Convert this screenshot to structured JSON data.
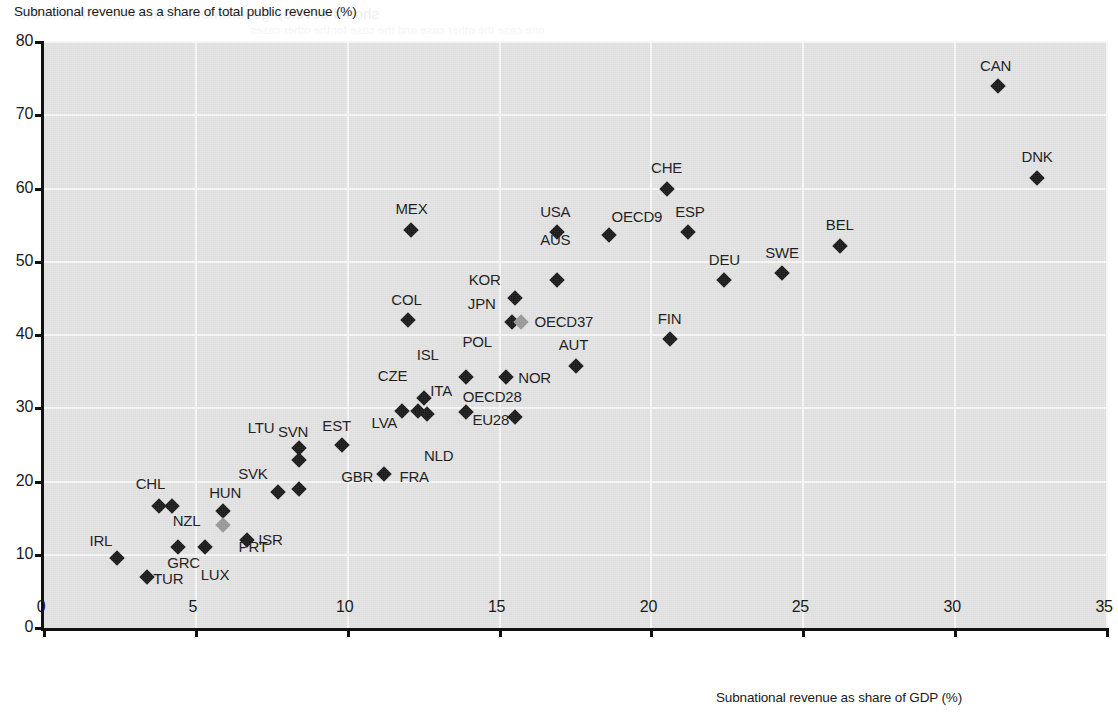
{
  "chart_data": {
    "type": "scatter",
    "title": "",
    "xlabel": "Subnational  revenue as share of GDP (%)",
    "ylabel": "Subnational revenue as a share of total public revenue (%)",
    "xlim": [
      0,
      35
    ],
    "ylim": [
      0,
      80
    ],
    "xticks": [
      "0",
      "5",
      "10",
      "15",
      "20",
      "25",
      "30",
      "35"
    ],
    "yticks": [
      "0",
      "10",
      "20",
      "30",
      "40",
      "50",
      "60",
      "70",
      "80"
    ],
    "grid": true,
    "legend": "none",
    "marker_shape": "diamond",
    "colors": {
      "marker_dark": "#1b1b1b",
      "marker_grey": "#9a9a9a",
      "plot_background": "#e3e3e3",
      "gridline": "#f7f7f7",
      "axis": "#111111"
    },
    "points": [
      {
        "code": "IRL",
        "x": 2.4,
        "y": 9.6,
        "color": "dark",
        "label_dx": -16,
        "label_dy": -26
      },
      {
        "code": "TUR",
        "x": 3.4,
        "y": 7.0,
        "color": "dark",
        "label_dx": 21,
        "label_dy": -7
      },
      {
        "code": "GRC",
        "x": 4.4,
        "y": 11.0,
        "color": "dark",
        "label_dx": 6,
        "label_dy": 7
      },
      {
        "code": "LUX",
        "x": 5.3,
        "y": 11.0,
        "color": "dark",
        "label_dx": 10,
        "label_dy": 19
      },
      {
        "code": "NZL",
        "x": 4.2,
        "y": 16.6,
        "color": "dark",
        "label_dx": 15,
        "label_dy": 6
      },
      {
        "code": "CHL",
        "x": 3.8,
        "y": 16.6,
        "color": "dark",
        "label_dx": -9,
        "label_dy": -31
      },
      {
        "code": "HUN",
        "x": 5.9,
        "y": 16.0,
        "color": "dark",
        "label_dx": 2,
        "label_dy": -27
      },
      {
        "code": "PRT",
        "x": 5.9,
        "y": 14.0,
        "color": "grey",
        "label_dx": 30,
        "label_dy": 13
      },
      {
        "code": "ISR",
        "x": 6.7,
        "y": 12.0,
        "color": "dark",
        "label_dx": 23,
        "label_dy": -9
      },
      {
        "code": "SVK",
        "x": 7.7,
        "y": 18.5,
        "color": "dark",
        "label_dx": -25,
        "label_dy": -27
      },
      {
        "code": "SVN",
        "x": 8.4,
        "y": 24.6,
        "color": "dark",
        "label_dx": -6,
        "label_dy": -25
      },
      {
        "code": "LTU",
        "x": 8.4,
        "y": 23.0,
        "color": "dark",
        "label_dx": -38,
        "label_dy": -41
      },
      {
        "code": "POL-low",
        "x": 8.4,
        "y": 19.0,
        "color": "dark",
        "label_dx": 0,
        "label_dy": 0,
        "no_label": true
      },
      {
        "code": "EST",
        "x": 9.8,
        "y": 25.0,
        "color": "dark",
        "label_dx": -5,
        "label_dy": -28
      },
      {
        "code": "GBR",
        "x": 11.2,
        "y": 21.0,
        "color": "dark",
        "label_dx": -27,
        "label_dy": -6
      },
      {
        "code": "FRA",
        "x": 11.2,
        "y": 21.0,
        "color": "dark",
        "label_dx": 30,
        "label_dy": -6,
        "no_marker": true
      },
      {
        "code": "LVA",
        "x": 11.8,
        "y": 29.6,
        "color": "dark",
        "label_dx": -18,
        "label_dy": 3
      },
      {
        "code": "CZE",
        "x": 12.3,
        "y": 29.6,
        "color": "dark",
        "label_dx": -25,
        "label_dy": -44
      },
      {
        "code": "ISL",
        "x": 12.5,
        "y": 31.4,
        "color": "dark",
        "label_dx": 4,
        "label_dy": -52
      },
      {
        "code": "NLD",
        "x": 12.6,
        "y": 29.2,
        "color": "dark",
        "label_dx": 12,
        "label_dy": 33
      },
      {
        "code": "COL",
        "x": 12.0,
        "y": 42.0,
        "color": "dark",
        "label_dx": -2,
        "label_dy": -29
      },
      {
        "code": "MEX",
        "x": 12.1,
        "y": 54.4,
        "color": "dark",
        "label_dx": 0,
        "label_dy": -30
      },
      {
        "code": "ITA",
        "x": 13.9,
        "y": 34.2,
        "color": "dark",
        "label_dx": -25,
        "label_dy": 5
      },
      {
        "code": "OECD28",
        "x": 13.9,
        "y": 29.5,
        "color": "dark",
        "label_dx": 26,
        "label_dy": -24
      },
      {
        "code": "POL",
        "x": 14.2,
        "y": 34.2,
        "color": "dark",
        "label_dx": 2,
        "label_dy": -44,
        "no_marker": true
      },
      {
        "code": "EU28",
        "x": 15.5,
        "y": 28.8,
        "color": "dark",
        "label_dx": -24,
        "label_dy": -6
      },
      {
        "code": "NOR",
        "x": 15.2,
        "y": 34.2,
        "color": "dark",
        "label_dx": 29,
        "label_dy": -8
      },
      {
        "code": "JPN",
        "x": 15.4,
        "y": 41.8,
        "color": "dark",
        "label_dx": -30,
        "label_dy": -27
      },
      {
        "code": "OECD37",
        "x": 15.7,
        "y": 41.8,
        "color": "grey",
        "label_dx": 43,
        "label_dy": -9
      },
      {
        "code": "KOR",
        "x": 15.5,
        "y": 45.0,
        "color": "dark",
        "label_dx": -30,
        "label_dy": -27
      },
      {
        "code": "AUS",
        "x": 16.9,
        "y": 47.5,
        "color": "dark",
        "label_dx": -2,
        "label_dy": -49
      },
      {
        "code": "USA",
        "x": 16.9,
        "y": 54.0,
        "color": "dark",
        "label_dx": -2,
        "label_dy": -29
      },
      {
        "code": "AUT",
        "x": 17.5,
        "y": 35.8,
        "color": "dark",
        "label_dx": -2,
        "label_dy": -30
      },
      {
        "code": "OECD9",
        "x": 18.6,
        "y": 53.7,
        "color": "dark",
        "label_dx": 28,
        "label_dy": -27
      },
      {
        "code": "CHE",
        "x": 20.5,
        "y": 60.0,
        "color": "dark",
        "label_dx": 0,
        "label_dy": -30
      },
      {
        "code": "FIN",
        "x": 20.6,
        "y": 39.5,
        "color": "dark",
        "label_dx": 0,
        "label_dy": -29
      },
      {
        "code": "ESP",
        "x": 21.2,
        "y": 54.0,
        "color": "dark",
        "label_dx": 2,
        "label_dy": -29
      },
      {
        "code": "DEU",
        "x": 22.4,
        "y": 47.5,
        "color": "dark",
        "label_dx": 0,
        "label_dy": -29
      },
      {
        "code": "SWE",
        "x": 24.3,
        "y": 48.5,
        "color": "dark",
        "label_dx": 0,
        "label_dy": -29
      },
      {
        "code": "BEL",
        "x": 26.2,
        "y": 52.2,
        "color": "dark",
        "label_dx": 0,
        "label_dy": -30
      },
      {
        "code": "CAN",
        "x": 31.4,
        "y": 74.0,
        "color": "dark",
        "label_dx": -2,
        "label_dy": -29
      },
      {
        "code": "DNK",
        "x": 32.7,
        "y": 61.4,
        "color": "dark",
        "label_dx": 0,
        "label_dy": -30
      }
    ]
  },
  "ghost_text": {
    "line1": "should develop governments other that. While in the",
    "line2": "one case the other case and the case for the other cases",
    "line3": "the case for the other cases in the case"
  }
}
